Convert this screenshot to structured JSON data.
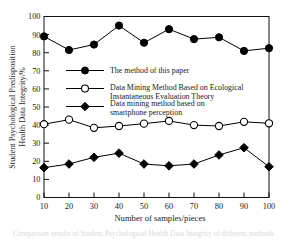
{
  "chart_data": {
    "type": "line",
    "title": "",
    "xlabel": "Number of samples/pieces",
    "ylabel": "Student Psychological Predisposition Health Data Integrity/%",
    "ylabel_line1": "Student Psychological Predisposition",
    "ylabel_line2": "Health Data Integrity/%",
    "x": [
      10,
      20,
      30,
      40,
      50,
      60,
      70,
      80,
      90,
      100
    ],
    "xticks": [
      "10",
      "20",
      "30",
      "40",
      "50",
      "60",
      "70",
      "80",
      "90",
      "100"
    ],
    "yticks": [
      "0",
      "10",
      "20",
      "30",
      "40",
      "50",
      "60",
      "70",
      "80",
      "90",
      "100"
    ],
    "xlim": [
      10,
      100
    ],
    "ylim": [
      0,
      100
    ],
    "grid": false,
    "legend_position": "upper-center-inside",
    "series": [
      {
        "name": "The method of this paper",
        "marker": "filled-circle",
        "color": "#000000",
        "values": [
          89.0,
          81.5,
          84.5,
          95.0,
          85.5,
          93.0,
          87.5,
          88.5,
          81.0,
          82.5
        ]
      },
      {
        "name": "Data Mining Method Based on Ecological Instantaneous Evaluation Theory",
        "marker": "open-circle",
        "color": "#000000",
        "values": [
          40.5,
          43.0,
          38.5,
          39.5,
          40.8,
          42.3,
          40.0,
          39.5,
          41.8,
          41.0
        ]
      },
      {
        "name": "Data mining method based on smartphone perception",
        "marker": "filled-diamond",
        "color": "#000000",
        "values": [
          16.5,
          18.5,
          22.2,
          24.5,
          18.5,
          17.5,
          18.5,
          23.5,
          27.5,
          17.0
        ]
      }
    ]
  },
  "legend": {
    "entries": [
      {
        "label": "The method of this paper",
        "lines": [
          "The method of this paper"
        ],
        "marker": "filled-circle"
      },
      {
        "label": "Data Mining Method Based on Ecological Instantaneous Evaluation Theory",
        "lines": [
          "Data Mining Method Based on Ecological",
          "Instantaneous Evaluation Theory"
        ],
        "marker": "open-circle"
      },
      {
        "label": "Data mining method based on smartphone perception",
        "lines": [
          "Data   mining   method   based   on",
          "smartphone perception"
        ],
        "marker": "filled-diamond"
      }
    ]
  },
  "caption": {
    "text": "Comparison results of Student Psychological Health Data Integrity of different methods"
  }
}
